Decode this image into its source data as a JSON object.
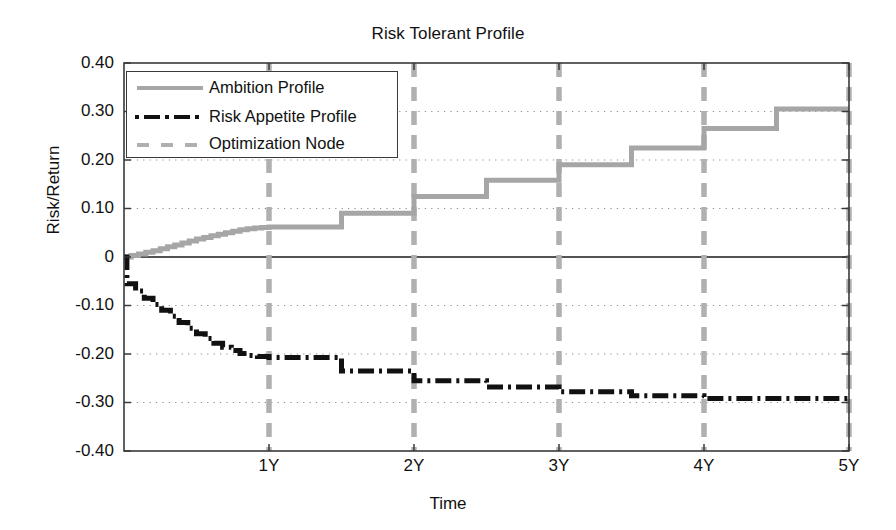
{
  "chart_data": {
    "type": "line",
    "title": "Risk Tolerant Profile",
    "xlabel": "Time",
    "ylabel": "Risk/Return",
    "xlim": [
      0,
      5
    ],
    "ylim": [
      -0.4,
      0.4
    ],
    "grid": "dotted-horizontal",
    "legend_position": "upper-left-inside",
    "x_tick_labels": [
      "1Y",
      "2Y",
      "3Y",
      "4Y",
      "5Y"
    ],
    "x_tick_values": [
      1,
      2,
      3,
      4,
      5
    ],
    "y_tick_labels": [
      "0.40",
      "0.30",
      "0.20",
      "0.10",
      "0",
      "-0.10",
      "-0.20",
      "-0.30",
      "-0.40"
    ],
    "y_tick_values": [
      0.4,
      0.3,
      0.2,
      0.1,
      0,
      -0.1,
      -0.2,
      -0.3,
      -0.4
    ],
    "series": [
      {
        "name": "Ambition Profile",
        "style": "solid",
        "color": "#a6a6a6",
        "note": "monotonically increasing staircase; fine sub-steps over year 0-1, then half-year plateaus",
        "x": [
          0,
          0.05,
          0.1,
          0.15,
          0.2,
          0.25,
          0.3,
          0.35,
          0.4,
          0.45,
          0.5,
          0.55,
          0.6,
          0.65,
          0.7,
          0.75,
          0.8,
          0.85,
          0.9,
          0.95,
          1.0,
          1.5,
          2.0,
          2.5,
          3.0,
          3.5,
          4.0,
          4.5,
          5.0
        ],
        "y": [
          0.0,
          0.003,
          0.006,
          0.01,
          0.013,
          0.017,
          0.021,
          0.025,
          0.029,
          0.033,
          0.037,
          0.04,
          0.044,
          0.047,
          0.05,
          0.053,
          0.056,
          0.058,
          0.06,
          0.061,
          0.062,
          0.09,
          0.125,
          0.158,
          0.19,
          0.225,
          0.265,
          0.305,
          0.305
        ]
      },
      {
        "name": "Risk Appetite Profile",
        "style": "dash-dot",
        "color": "#111111",
        "note": "monotonically decreasing staircase; initial vertical drop then fine sub-steps over year 0-1, then half-year plateaus",
        "x": [
          0,
          0.02,
          0.08,
          0.14,
          0.2,
          0.26,
          0.32,
          0.38,
          0.44,
          0.5,
          0.56,
          0.62,
          0.68,
          0.74,
          0.8,
          0.86,
          0.92,
          1.0,
          1.5,
          2.0,
          2.5,
          3.0,
          3.5,
          4.0,
          5.0
        ],
        "y": [
          0.0,
          -0.055,
          -0.07,
          -0.085,
          -0.098,
          -0.11,
          -0.122,
          -0.135,
          -0.147,
          -0.158,
          -0.168,
          -0.178,
          -0.186,
          -0.193,
          -0.199,
          -0.203,
          -0.205,
          -0.207,
          -0.235,
          -0.255,
          -0.268,
          -0.278,
          -0.286,
          -0.292,
          -0.295
        ]
      },
      {
        "name": "Optimization Node",
        "style": "dashed-vertical",
        "color": "#b0b0b0",
        "note": "vertical dashed markers spanning full plot height at each year",
        "x": [
          1,
          2,
          3,
          4,
          5
        ]
      }
    ],
    "legend": [
      {
        "label": "Ambition Profile",
        "style": "solid",
        "color": "#a6a6a6"
      },
      {
        "label": "Risk Appetite Profile",
        "style": "dash-dot",
        "color": "#111111"
      },
      {
        "label": "Optimization Node",
        "style": "dashed",
        "color": "#b0b0b0"
      }
    ]
  },
  "colors": {
    "ambition": "#a6a6a6",
    "risk_appetite": "#111111",
    "optimization_node": "#b0b0b0",
    "axis": "#3a3a3a",
    "grid": "#8a8a8a",
    "background": "#ffffff"
  }
}
